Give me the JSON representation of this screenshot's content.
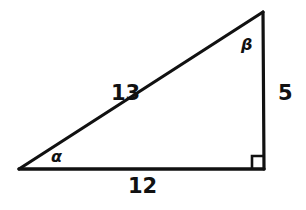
{
  "diagram": {
    "type": "right-triangle",
    "colors": {
      "stroke": "#111111",
      "background": "#ffffff"
    },
    "vertices": {
      "left": [
        19,
        169
      ],
      "right_angle": [
        264,
        169
      ],
      "top": [
        263,
        12
      ]
    },
    "sides": {
      "hypotenuse": {
        "label": "13"
      },
      "base": {
        "label": "12"
      },
      "height": {
        "label": "5"
      }
    },
    "angles": {
      "alpha": {
        "label": "α",
        "vertex": "left"
      },
      "beta": {
        "label": "β",
        "vertex": "top"
      },
      "right_angle_marker": true
    }
  }
}
